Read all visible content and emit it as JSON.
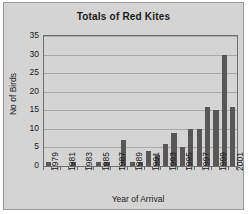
{
  "chart_data": {
    "type": "bar",
    "title": "Totals of Red Kites",
    "xlabel": "Year of Arrival",
    "ylabel": "No of Birds",
    "categories": [
      "1979",
      "1980",
      "1981",
      "1982",
      "1983",
      "1984",
      "1985",
      "1986",
      "1987",
      "1988",
      "1989",
      "1990",
      "1991",
      "1992",
      "1993",
      "1994",
      "1995",
      "1996",
      "1997",
      "1998",
      "1999",
      "2000",
      "2001"
    ],
    "values": [
      1,
      0,
      0,
      1,
      0,
      0,
      1,
      1,
      0,
      7,
      1,
      1,
      4,
      3,
      6,
      9,
      5,
      10,
      10,
      16,
      15,
      30,
      16
    ],
    "ylim": [
      0,
      35
    ],
    "yticks": [
      0,
      5,
      10,
      15,
      20,
      25,
      30,
      35
    ],
    "xtick_labels": [
      "1979",
      "1981",
      "1983",
      "1985",
      "1987",
      "1989",
      "1991",
      "1993",
      "1995",
      "1997",
      "1999",
      "2001"
    ],
    "grid": true,
    "legend": false,
    "bar_color": "#575757",
    "plot_background": "#d4d4d4",
    "axis_color": "#6f6f6f",
    "gridline_color": "#a9a9a9"
  }
}
